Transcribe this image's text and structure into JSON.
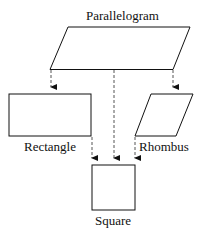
{
  "diagram": {
    "nodes": [
      {
        "id": "parallelogram",
        "label": "Parallelogram"
      },
      {
        "id": "rectangle",
        "label": "Rectangle"
      },
      {
        "id": "rhombus",
        "label": "Rhombus"
      },
      {
        "id": "square",
        "label": "Square"
      }
    ],
    "edges": [
      {
        "from": "parallelogram",
        "to": "rectangle",
        "style": "dashed-arrow"
      },
      {
        "from": "parallelogram",
        "to": "rhombus",
        "style": "dashed-arrow"
      },
      {
        "from": "parallelogram",
        "to": "square",
        "style": "dashed-arrow"
      },
      {
        "from": "rectangle",
        "to": "square",
        "style": "dashed-arrow"
      },
      {
        "from": "rhombus",
        "to": "square",
        "style": "dashed-arrow"
      }
    ],
    "colors": {
      "stroke": "#111111",
      "dash": "#555555"
    }
  }
}
